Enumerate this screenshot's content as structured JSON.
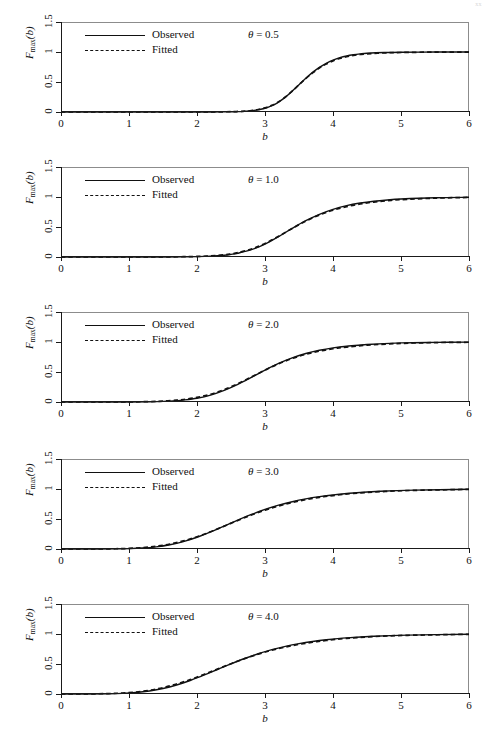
{
  "page": {
    "corner_mark": "xx"
  },
  "axes": {
    "x_label": "b",
    "y_label_main": "F",
    "y_label_sub": "max",
    "y_label_arg": "(b)",
    "x_ticks": [
      0,
      1,
      2,
      3,
      4,
      5,
      6
    ],
    "x_tick_labels": [
      "0",
      "1",
      "2",
      "3",
      "4",
      "5",
      "6"
    ],
    "y_ticks": [
      0,
      0.5,
      1,
      1.5
    ],
    "y_tick_labels": [
      "0",
      "0.5",
      "1",
      "1.5"
    ],
    "xlim": [
      0,
      6
    ],
    "ylim": [
      0,
      1.5
    ],
    "grid": false
  },
  "legend": {
    "position": "top-left-inside",
    "entries": [
      {
        "label": "Observed",
        "style": "solid"
      },
      {
        "label": "Fitted",
        "style": "dashed"
      }
    ]
  },
  "colors": {
    "curve": "#111111",
    "frame": "#8c8c8c",
    "axis": "#1a1a1a",
    "background": "#ffffff"
  },
  "chart_data": [
    {
      "type": "line",
      "title": "",
      "annotation": "θ = 0.5",
      "theta": 0.5,
      "xlabel": "b",
      "ylabel": "F_max(b)",
      "xlim": [
        0,
        6
      ],
      "ylim": [
        0,
        1.5
      ],
      "grid": false,
      "x": [
        0.0,
        0.25,
        0.5,
        0.75,
        1.0,
        1.25,
        1.5,
        1.75,
        2.0,
        2.25,
        2.5,
        2.6,
        2.7,
        2.8,
        2.9,
        3.0,
        3.1,
        3.2,
        3.3,
        3.4,
        3.5,
        3.6,
        3.7,
        3.8,
        3.9,
        4.0,
        4.1,
        4.2,
        4.3,
        4.4,
        4.5,
        4.75,
        5.0,
        5.5,
        6.0
      ],
      "series": [
        {
          "name": "Observed",
          "style": "solid",
          "values": [
            0.0,
            0.0,
            0.0,
            0.0,
            0.0,
            0.0,
            0.0,
            0.0,
            0.0,
            0.001,
            0.003,
            0.006,
            0.011,
            0.02,
            0.036,
            0.062,
            0.105,
            0.166,
            0.248,
            0.348,
            0.456,
            0.562,
            0.66,
            0.744,
            0.812,
            0.865,
            0.905,
            0.934,
            0.954,
            0.968,
            0.978,
            0.991,
            0.996,
            0.999,
            1.0
          ]
        },
        {
          "name": "Fitted",
          "style": "dashed",
          "values": [
            0.0,
            0.0,
            0.0,
            0.0,
            0.0,
            0.0,
            0.0,
            0.0,
            0.001,
            0.002,
            0.005,
            0.009,
            0.015,
            0.025,
            0.042,
            0.068,
            0.11,
            0.17,
            0.25,
            0.348,
            0.454,
            0.558,
            0.652,
            0.734,
            0.8,
            0.852,
            0.892,
            0.921,
            0.942,
            0.958,
            0.969,
            0.985,
            0.992,
            0.998,
            0.999
          ]
        }
      ]
    },
    {
      "type": "line",
      "title": "",
      "annotation": "θ = 1.0",
      "theta": 1.0,
      "xlabel": "b",
      "ylabel": "F_max(b)",
      "xlim": [
        0,
        6
      ],
      "ylim": [
        0,
        1.5
      ],
      "grid": false,
      "x": [
        0.0,
        0.5,
        1.0,
        1.5,
        1.8,
        2.0,
        2.2,
        2.4,
        2.5,
        2.6,
        2.8,
        3.0,
        3.2,
        3.4,
        3.6,
        3.8,
        4.0,
        4.2,
        4.4,
        4.6,
        4.8,
        5.0,
        5.5,
        6.0
      ],
      "series": [
        {
          "name": "Observed",
          "style": "solid",
          "values": [
            0.0,
            0.0,
            0.0,
            0.001,
            0.003,
            0.006,
            0.014,
            0.03,
            0.044,
            0.063,
            0.122,
            0.216,
            0.34,
            0.477,
            0.605,
            0.712,
            0.795,
            0.856,
            0.899,
            0.93,
            0.951,
            0.966,
            0.987,
            0.996
          ]
        },
        {
          "name": "Fitted",
          "style": "dashed",
          "values": [
            0.0,
            0.0,
            0.0,
            0.002,
            0.005,
            0.009,
            0.019,
            0.037,
            0.052,
            0.072,
            0.132,
            0.225,
            0.345,
            0.476,
            0.598,
            0.7,
            0.78,
            0.84,
            0.884,
            0.916,
            0.939,
            0.956,
            0.981,
            0.993
          ]
        }
      ]
    },
    {
      "type": "line",
      "title": "",
      "annotation": "θ = 2.0",
      "theta": 2.0,
      "xlabel": "b",
      "ylabel": "F_max(b)",
      "xlim": [
        0,
        6
      ],
      "ylim": [
        0,
        1.5
      ],
      "grid": false,
      "x": [
        0.0,
        0.5,
        1.0,
        1.3,
        1.5,
        1.7,
        1.8,
        2.0,
        2.2,
        2.4,
        2.6,
        2.8,
        3.0,
        3.2,
        3.4,
        3.6,
        3.8,
        4.0,
        4.2,
        4.5,
        5.0,
        5.5,
        6.0
      ],
      "series": [
        {
          "name": "Observed",
          "style": "solid",
          "values": [
            0.0,
            0.0,
            0.001,
            0.004,
            0.01,
            0.022,
            0.032,
            0.063,
            0.115,
            0.193,
            0.294,
            0.411,
            0.531,
            0.642,
            0.735,
            0.808,
            0.862,
            0.902,
            0.93,
            0.959,
            0.985,
            0.994,
            0.998
          ]
        },
        {
          "name": "Fitted",
          "style": "dashed",
          "values": [
            0.0,
            0.0,
            0.002,
            0.007,
            0.015,
            0.03,
            0.042,
            0.076,
            0.13,
            0.207,
            0.305,
            0.417,
            0.531,
            0.637,
            0.725,
            0.795,
            0.848,
            0.887,
            0.916,
            0.947,
            0.977,
            0.99,
            0.996
          ]
        }
      ]
    },
    {
      "type": "line",
      "title": "",
      "annotation": "θ = 3.0",
      "theta": 3.0,
      "xlabel": "b",
      "ylabel": "F_max(b)",
      "xlim": [
        0,
        6
      ],
      "ylim": [
        0,
        1.5
      ],
      "grid": false,
      "x": [
        0.0,
        0.4,
        0.8,
        1.0,
        1.2,
        1.4,
        1.6,
        1.8,
        2.0,
        2.2,
        2.4,
        2.6,
        2.8,
        3.0,
        3.2,
        3.4,
        3.6,
        3.8,
        4.0,
        4.3,
        4.7,
        5.2,
        6.0
      ],
      "series": [
        {
          "name": "Observed",
          "style": "solid",
          "values": [
            0.0,
            0.0,
            0.002,
            0.006,
            0.016,
            0.036,
            0.071,
            0.124,
            0.196,
            0.285,
            0.383,
            0.483,
            0.576,
            0.659,
            0.73,
            0.788,
            0.835,
            0.872,
            0.901,
            0.934,
            0.962,
            0.981,
            0.996
          ]
        },
        {
          "name": "Fitted",
          "style": "dashed",
          "values": [
            0.0,
            0.001,
            0.004,
            0.01,
            0.023,
            0.046,
            0.082,
            0.135,
            0.204,
            0.288,
            0.381,
            0.476,
            0.566,
            0.647,
            0.717,
            0.775,
            0.823,
            0.861,
            0.891,
            0.926,
            0.956,
            0.977,
            0.994
          ]
        }
      ]
    },
    {
      "type": "line",
      "title": "",
      "annotation": "θ = 4.0",
      "theta": 4.0,
      "xlabel": "b",
      "ylabel": "F_max(b)",
      "xlim": [
        0,
        6
      ],
      "ylim": [
        0,
        1.5
      ],
      "grid": false,
      "x": [
        0.0,
        0.4,
        0.7,
        0.9,
        1.1,
        1.3,
        1.5,
        1.7,
        1.9,
        2.1,
        2.3,
        2.5,
        2.7,
        2.9,
        3.1,
        3.3,
        3.5,
        3.7,
        3.9,
        4.2,
        4.6,
        5.1,
        6.0
      ],
      "series": [
        {
          "name": "Observed",
          "style": "solid",
          "values": [
            0.0,
            0.001,
            0.004,
            0.01,
            0.024,
            0.05,
            0.091,
            0.15,
            0.225,
            0.313,
            0.408,
            0.503,
            0.592,
            0.671,
            0.739,
            0.794,
            0.839,
            0.875,
            0.903,
            0.935,
            0.963,
            0.982,
            0.997
          ]
        },
        {
          "name": "Fitted",
          "style": "dashed",
          "values": [
            0.0,
            0.002,
            0.007,
            0.016,
            0.033,
            0.062,
            0.106,
            0.166,
            0.24,
            0.325,
            0.415,
            0.505,
            0.589,
            0.664,
            0.729,
            0.783,
            0.827,
            0.863,
            0.892,
            0.927,
            0.957,
            0.978,
            0.995
          ]
        }
      ]
    }
  ]
}
